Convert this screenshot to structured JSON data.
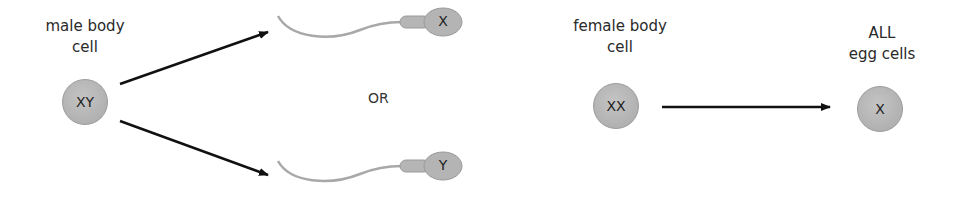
{
  "male": {
    "label_line1": "male body",
    "label_line2": "cell",
    "cell_genotype": "XY"
  },
  "sperm": [
    {
      "chromosome": "X"
    },
    {
      "chromosome": "Y"
    }
  ],
  "connector": "OR",
  "female": {
    "label_line1": "female body",
    "label_line2": "cell",
    "cell_genotype": "XX"
  },
  "egg": {
    "label_line1": "ALL",
    "label_line2": "egg cells",
    "chromosome": "X"
  },
  "colors": {
    "cell_fill": "#b8b8b8",
    "arrow": "#111111",
    "sperm_tail": "#a8a8a8"
  }
}
